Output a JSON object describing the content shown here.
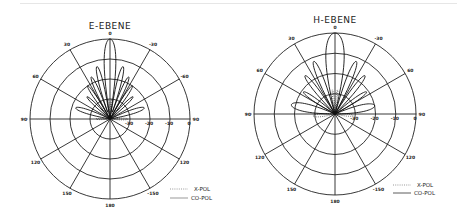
{
  "chart_data": [
    {
      "type": "polar",
      "title": "E-EBENE",
      "center": [
        110,
        119
      ],
      "radius": 80,
      "angle_labels": [
        {
          "angle": 0,
          "label": "0"
        },
        {
          "angle": 30,
          "label": "30"
        },
        {
          "angle": -30,
          "label": "-30"
        },
        {
          "angle": 60,
          "label": "60"
        },
        {
          "angle": -60,
          "label": "-60"
        },
        {
          "angle": 90,
          "label": "90"
        },
        {
          "angle": -90,
          "label": "90"
        },
        {
          "angle": 120,
          "label": "120"
        },
        {
          "angle": -120,
          "label": "120"
        },
        {
          "angle": 150,
          "label": "150"
        },
        {
          "angle": -150,
          "label": "-150"
        },
        {
          "angle": 180,
          "label": "180"
        }
      ],
      "radial_labels": [
        "-30",
        "-20",
        "-10",
        "0"
      ],
      "rlim_db": [
        -40,
        0
      ],
      "grid": true,
      "series": [
        {
          "name": "CO-POL",
          "style": "solid",
          "lobes": [
            {
              "angle": 0,
              "level_db": 0,
              "width": 9
            },
            {
              "angle": 14,
              "level_db": -13,
              "width": 6
            },
            {
              "angle": -14,
              "level_db": -13,
              "width": 6
            },
            {
              "angle": 24,
              "level_db": -17,
              "width": 6
            },
            {
              "angle": -24,
              "level_db": -17,
              "width": 6
            },
            {
              "angle": 34,
              "level_db": -20,
              "width": 6
            },
            {
              "angle": -34,
              "level_db": -20,
              "width": 6
            },
            {
              "angle": 46,
              "level_db": -24,
              "width": 7
            },
            {
              "angle": -46,
              "level_db": -24,
              "width": 7
            },
            {
              "angle": 72,
              "level_db": -22,
              "width": 10
            },
            {
              "angle": -72,
              "level_db": -22,
              "width": 10
            }
          ]
        },
        {
          "name": "X-POL",
          "style": "dotted",
          "lobes": [
            {
              "angle": 5,
              "level_db": -30,
              "width": 6
            },
            {
              "angle": -5,
              "level_db": -30,
              "width": 6
            },
            {
              "angle": 90,
              "level_db": -33,
              "width": 12
            },
            {
              "angle": -90,
              "level_db": -31,
              "width": 12
            }
          ]
        }
      ],
      "legend": {
        "position": "lower right",
        "entries": [
          "X-POL",
          "CO-POL"
        ]
      }
    },
    {
      "type": "polar",
      "title": "H-EBENE",
      "center": [
        335,
        114
      ],
      "radius": 81,
      "angle_labels": [
        {
          "angle": 0,
          "label": "0"
        },
        {
          "angle": 30,
          "label": "30"
        },
        {
          "angle": -30,
          "label": "-30"
        },
        {
          "angle": 60,
          "label": "60"
        },
        {
          "angle": -60,
          "label": "60"
        },
        {
          "angle": 90,
          "label": "90"
        },
        {
          "angle": -90,
          "label": "90"
        },
        {
          "angle": 120,
          "label": "120"
        },
        {
          "angle": -120,
          "label": "120"
        },
        {
          "angle": 150,
          "label": "150"
        },
        {
          "angle": -150,
          "label": "-150"
        },
        {
          "angle": 180,
          "label": "180"
        }
      ],
      "radial_labels": [
        "-30",
        "-20",
        "-10",
        "0"
      ],
      "rlim_db": [
        -40,
        0
      ],
      "grid": true,
      "series": [
        {
          "name": "CO-POL",
          "style": "solid",
          "lobes": [
            {
              "angle": 0,
              "level_db": 0,
              "width": 14
            },
            {
              "angle": 22,
              "level_db": -12,
              "width": 7
            },
            {
              "angle": -22,
              "level_db": -12,
              "width": 7
            },
            {
              "angle": 38,
              "level_db": -16,
              "width": 7
            },
            {
              "angle": -38,
              "level_db": -16,
              "width": 7
            },
            {
              "angle": 55,
              "level_db": -21,
              "width": 8
            },
            {
              "angle": -55,
              "level_db": -21,
              "width": 8
            },
            {
              "angle": 78,
              "level_db": -18,
              "width": 14
            },
            {
              "angle": -78,
              "level_db": -20,
              "width": 14
            }
          ]
        },
        {
          "name": "X-POL",
          "style": "dotted",
          "lobes": [
            {
              "angle": 6,
              "level_db": -28,
              "width": 6
            },
            {
              "angle": -6,
              "level_db": -28,
              "width": 6
            },
            {
              "angle": 95,
              "level_db": -29,
              "width": 14
            },
            {
              "angle": -95,
              "level_db": -31,
              "width": 14
            }
          ]
        }
      ],
      "legend": {
        "position": "lower right",
        "entries": [
          "X-POL",
          "CO-POL"
        ]
      }
    }
  ],
  "legend_left": {
    "xpol": "X-POL",
    "copol": "CO-POL"
  },
  "legend_right": {
    "xpol": "X-POL",
    "copol": "CO-POL"
  },
  "titles": {
    "left": "E-EBENE",
    "right": "H-EBENE"
  }
}
